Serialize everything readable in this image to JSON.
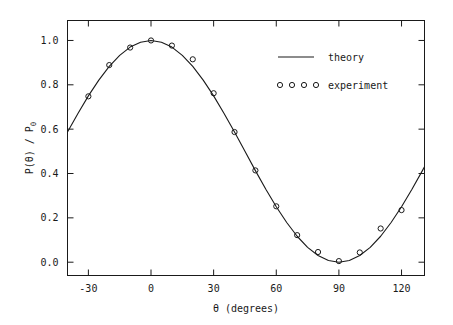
{
  "chart_data": {
    "type": "line",
    "title": "",
    "subtitle": "",
    "xlabel": "θ  (degrees)",
    "ylabel": "P(θ) / P",
    "ylabel_sub": "0",
    "xlim": [
      -40,
      131
    ],
    "ylim": [
      -0.06,
      1.09
    ],
    "xticks": [
      -30,
      0,
      30,
      60,
      90,
      120
    ],
    "xtick_labels": [
      "-30",
      "0",
      "30",
      "60",
      "90",
      "120"
    ],
    "yticks": [
      0.0,
      0.2,
      0.4,
      0.6,
      0.8,
      1.0
    ],
    "ytick_labels": [
      "0.0",
      "0.2",
      "0.4",
      "0.6",
      "0.8",
      "1.0"
    ],
    "grid": false,
    "legend_position": "top-right",
    "series": [
      {
        "name": "theory",
        "type": "line",
        "style": "solid",
        "color": "#1a1a1a",
        "formula": "cos^2(theta)",
        "x": [
          -40,
          -35,
          -30,
          -25,
          -20,
          -15,
          -10,
          -5,
          0,
          5,
          10,
          15,
          20,
          25,
          30,
          35,
          40,
          45,
          50,
          55,
          60,
          65,
          70,
          75,
          80,
          85,
          90,
          95,
          100,
          105,
          110,
          115,
          120,
          125,
          130,
          131
        ],
        "y": [
          0.587,
          0.671,
          0.75,
          0.821,
          0.883,
          0.933,
          0.97,
          0.992,
          1.0,
          0.992,
          0.97,
          0.933,
          0.883,
          0.821,
          0.75,
          0.671,
          0.587,
          0.5,
          0.413,
          0.329,
          0.25,
          0.179,
          0.117,
          0.067,
          0.03,
          0.008,
          0.0,
          0.008,
          0.03,
          0.067,
          0.117,
          0.179,
          0.25,
          0.329,
          0.413,
          0.43
        ]
      },
      {
        "name": "experiment",
        "type": "scatter",
        "marker": "circle",
        "color": "#1a1a1a",
        "x": [
          -30,
          -20,
          -10,
          0,
          10,
          20,
          30,
          40,
          50,
          60,
          70,
          80,
          90,
          100,
          110,
          120
        ],
        "y": [
          0.748,
          0.889,
          0.968,
          1.0,
          0.977,
          0.915,
          0.762,
          0.587,
          0.414,
          0.252,
          0.122,
          0.046,
          0.005,
          0.044,
          0.152,
          0.235
        ]
      }
    ],
    "legend_entries": [
      {
        "label": "theory",
        "marker": "line"
      },
      {
        "label": "experiment",
        "marker": "circles",
        "marker_count": 4
      }
    ]
  }
}
